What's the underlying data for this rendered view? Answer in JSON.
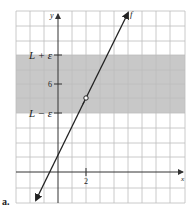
{
  "figure": {
    "panel_label": "a.",
    "axes": {
      "x_label": "x",
      "y_label": "y",
      "x_tick_label": "2",
      "y_tick_label": "6"
    },
    "band": {
      "upper_label": "L + ε",
      "lower_label": "L − ε",
      "color": "#c8c8c8"
    },
    "curve": {
      "label": "f",
      "color": "#222222"
    },
    "point": {
      "type": "hollow-circle",
      "x": 2,
      "y": 5
    },
    "colors": {
      "grid": "#bdbdbd",
      "axis": "#333333",
      "background": "#ffffff"
    }
  }
}
